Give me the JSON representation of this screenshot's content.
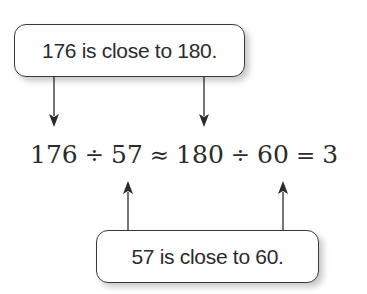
{
  "top_callout": {
    "text": "176 is close to 180."
  },
  "bottom_callout": {
    "text": "57 is close to 60."
  },
  "equation": {
    "dividend_original": "176",
    "op_divide_1": "÷",
    "divisor_original": "57",
    "op_approx": "≈",
    "dividend_rounded": "180",
    "op_divide_2": "÷",
    "divisor_rounded": "60",
    "op_equals": "=",
    "result": "3"
  },
  "arrows": [
    {
      "from": "top_callout",
      "to": "dividend_original",
      "direction": "down"
    },
    {
      "from": "top_callout",
      "to": "dividend_rounded",
      "direction": "down"
    },
    {
      "from": "bottom_callout",
      "to": "divisor_original",
      "direction": "up"
    },
    {
      "from": "bottom_callout",
      "to": "divisor_rounded",
      "direction": "up"
    }
  ],
  "colors": {
    "ink": "#2b2b2b",
    "background": "#ffffff"
  }
}
